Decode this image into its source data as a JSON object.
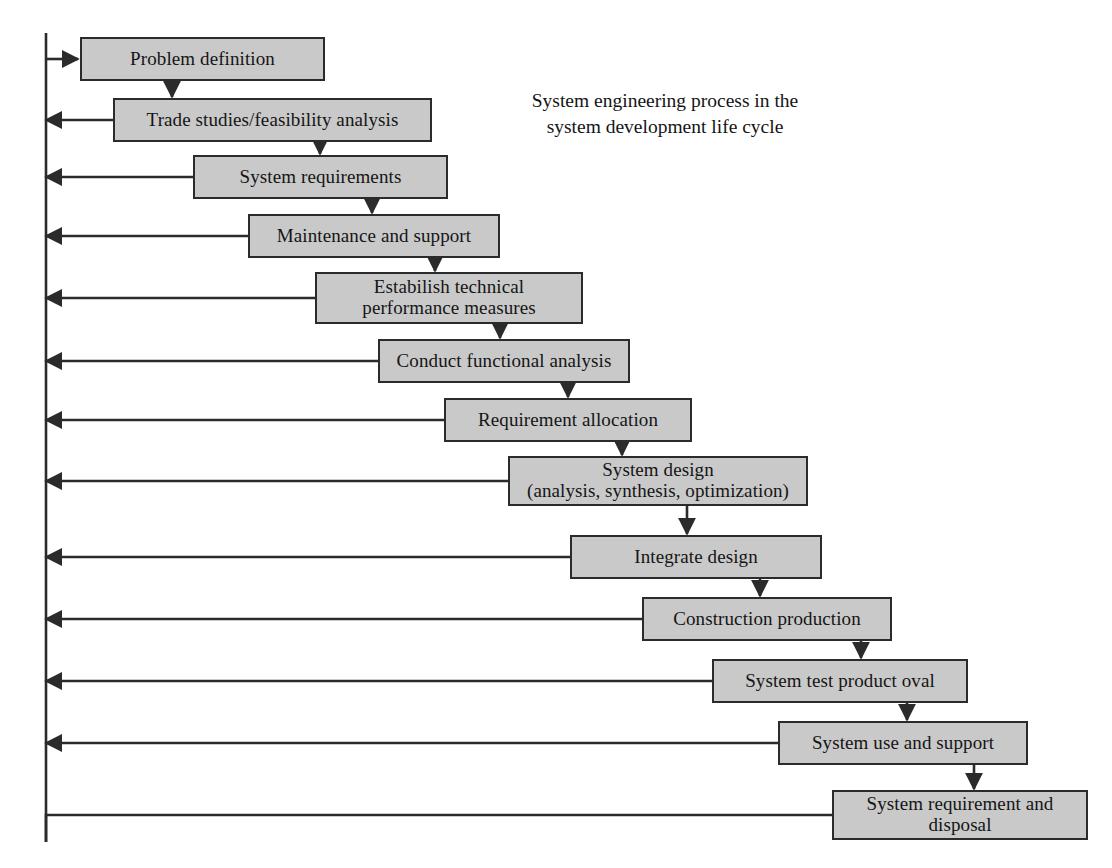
{
  "diagram": {
    "title": "System engineering process in the\nsystem development life cycle",
    "title_lines": [
      "System engineering process in the",
      "system development life cycle"
    ],
    "colors": {
      "box_fill": "#c9c9c9",
      "box_border": "#2b2b2b",
      "line": "#2b2b2b",
      "background": "#ffffff",
      "text": "#151515"
    },
    "feedback_spine": {
      "label": "feedback-spine",
      "x": 46,
      "top": 33,
      "bottom": 842
    },
    "nodes": [
      {
        "id": "problem-definition",
        "label": "Problem definition",
        "x": 80,
        "y": 37,
        "w": 245,
        "h": 44,
        "feedback": "in"
      },
      {
        "id": "trade-studies",
        "label": "Trade studies/feasibility analysis",
        "x": 113,
        "y": 98,
        "w": 319,
        "h": 44,
        "feedback": "out"
      },
      {
        "id": "system-requirements",
        "label": "System requirements",
        "x": 193,
        "y": 155,
        "w": 255,
        "h": 44,
        "feedback": "out"
      },
      {
        "id": "maintenance-and-support",
        "label": "Maintenance and support",
        "x": 248,
        "y": 214,
        "w": 252,
        "h": 44,
        "feedback": "out"
      },
      {
        "id": "technical-performance",
        "label": "Estabilish technical\nperformance measures",
        "x": 315,
        "y": 272,
        "w": 268,
        "h": 52,
        "feedback": "out"
      },
      {
        "id": "conduct-functional",
        "label": "Conduct functional analysis",
        "x": 378,
        "y": 339,
        "w": 252,
        "h": 44,
        "feedback": "out"
      },
      {
        "id": "requirement-allocation",
        "label": "Requirement allocation",
        "x": 444,
        "y": 398,
        "w": 248,
        "h": 44,
        "feedback": "out"
      },
      {
        "id": "system-design",
        "label": "System design\n(analysis, synthesis, optimization)",
        "x": 508,
        "y": 456,
        "w": 300,
        "h": 50,
        "feedback": "out"
      },
      {
        "id": "integrate-design",
        "label": "Integrate design",
        "x": 570,
        "y": 535,
        "w": 252,
        "h": 44,
        "feedback": "out"
      },
      {
        "id": "construction-production",
        "label": "Construction production",
        "x": 642,
        "y": 597,
        "w": 250,
        "h": 44,
        "feedback": "out"
      },
      {
        "id": "system-test-product-oval",
        "label": "System test product oval",
        "x": 712,
        "y": 659,
        "w": 256,
        "h": 44,
        "feedback": "out"
      },
      {
        "id": "system-use-and-support",
        "label": "System use and support",
        "x": 778,
        "y": 721,
        "w": 250,
        "h": 44,
        "feedback": "out"
      },
      {
        "id": "system-requirement-disposal",
        "label": "System requirement and\ndisposal",
        "x": 832,
        "y": 790,
        "w": 256,
        "h": 50,
        "feedback": "bottom"
      }
    ],
    "down_arrows": [
      {
        "from": "problem-definition",
        "to": "trade-studies",
        "x": 172
      },
      {
        "from": "trade-studies",
        "to": "system-requirements",
        "x": 320
      },
      {
        "from": "system-requirements",
        "to": "maintenance-and-support",
        "x": 372
      },
      {
        "from": "maintenance-and-support",
        "to": "technical-performance",
        "x": 435
      },
      {
        "from": "technical-performance",
        "to": "conduct-functional",
        "x": 500
      },
      {
        "from": "conduct-functional",
        "to": "requirement-allocation",
        "x": 568
      },
      {
        "from": "requirement-allocation",
        "to": "system-design",
        "x": 622
      },
      {
        "from": "system-design",
        "to": "integrate-design",
        "x": 687
      },
      {
        "from": "integrate-design",
        "to": "construction-production",
        "x": 760
      },
      {
        "from": "construction-production",
        "to": "system-test-product-oval",
        "x": 861
      },
      {
        "from": "system-test-product-oval",
        "to": "system-use-and-support",
        "x": 907
      },
      {
        "from": "system-use-and-support",
        "to": "system-requirement-disposal",
        "x": 974
      }
    ]
  }
}
